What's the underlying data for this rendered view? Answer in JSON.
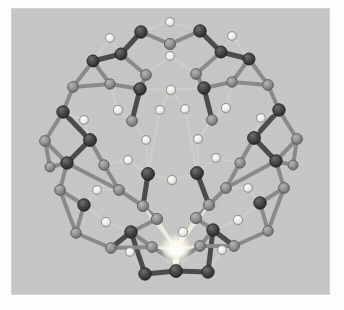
{
  "figure": {
    "kind": "molecular-structure-render",
    "background_color": "#c7c7c7",
    "page_color": "#fdfdfd",
    "panel": {
      "x": 11,
      "y": 8,
      "width": 319,
      "height": 287
    }
  },
  "palette": {
    "background": "#c7c7c7",
    "atom_dark": "#3b3b3b",
    "atom_dark_edge": "#202020",
    "atom_mid": "#8e8e8e",
    "atom_mid_edge": "#5e5e5e",
    "atom_light": "#e9e9e4",
    "atom_light_edge": "#9a9a95",
    "bond_dark": "#4a4a4a",
    "bond_mid": "#8a8a8a",
    "bond_light": "#cfcfca",
    "highlight": "#ffffff",
    "highlight_glow": "#fffdf2"
  },
  "legend": {
    "atom_types": [
      {
        "name": "dark-vertex-atom",
        "color": "#3b3b3b",
        "radius": 6.4,
        "role": "framework tetrahedral site"
      },
      {
        "name": "mid-vertex-atom",
        "color": "#8e8e8e",
        "radius": 5.6,
        "role": "framework tetrahedral site (back face)"
      },
      {
        "name": "light-bridge-atom",
        "color": "#e9e9e4",
        "radius": 4.6,
        "role": "bridging atom"
      },
      {
        "name": "highlight-atom",
        "color": "#ffffff",
        "radius": 5.0,
        "role": "selected / emitting atom"
      }
    ]
  },
  "structure": {
    "highlight_atom": {
      "id": "H0",
      "x": 176,
      "y": 249,
      "r": 5.2,
      "type": "highlight"
    },
    "atoms": [
      {
        "id": "a0",
        "x": 170,
        "y": 22,
        "r": 4.4,
        "type": "light"
      },
      {
        "id": "a1",
        "x": 141,
        "y": 32,
        "r": 6.2,
        "type": "dark"
      },
      {
        "id": "a2",
        "x": 200,
        "y": 31,
        "r": 6.2,
        "type": "dark"
      },
      {
        "id": "a3",
        "x": 170,
        "y": 44,
        "r": 5.6,
        "type": "mid"
      },
      {
        "id": "a4",
        "x": 170,
        "y": 56,
        "r": 4.4,
        "type": "light"
      },
      {
        "id": "a5",
        "x": 121,
        "y": 54,
        "r": 6.0,
        "type": "dark"
      },
      {
        "id": "a6",
        "x": 221,
        "y": 52,
        "r": 6.0,
        "type": "dark"
      },
      {
        "id": "a7",
        "x": 146,
        "y": 75,
        "r": 5.4,
        "type": "mid"
      },
      {
        "id": "a8",
        "x": 196,
        "y": 74,
        "r": 5.4,
        "type": "mid"
      },
      {
        "id": "a9",
        "x": 171,
        "y": 90,
        "r": 4.6,
        "type": "light"
      },
      {
        "id": "a10",
        "x": 140,
        "y": 89,
        "r": 6.2,
        "type": "dark"
      },
      {
        "id": "a11",
        "x": 204,
        "y": 88,
        "r": 6.2,
        "type": "dark"
      },
      {
        "id": "a12",
        "x": 93,
        "y": 61,
        "r": 6.0,
        "type": "dark"
      },
      {
        "id": "a13",
        "x": 249,
        "y": 59,
        "r": 6.0,
        "type": "dark"
      },
      {
        "id": "a14",
        "x": 73,
        "y": 87,
        "r": 5.4,
        "type": "mid"
      },
      {
        "id": "a15",
        "x": 268,
        "y": 85,
        "r": 5.4,
        "type": "mid"
      },
      {
        "id": "a16",
        "x": 110,
        "y": 84,
        "r": 5.2,
        "type": "mid"
      },
      {
        "id": "a17",
        "x": 232,
        "y": 82,
        "r": 5.2,
        "type": "mid"
      },
      {
        "id": "a18",
        "x": 63,
        "y": 112,
        "r": 6.2,
        "type": "dark"
      },
      {
        "id": "a19",
        "x": 279,
        "y": 110,
        "r": 6.2,
        "type": "dark"
      },
      {
        "id": "a20",
        "x": 118,
        "y": 110,
        "r": 4.6,
        "type": "light"
      },
      {
        "id": "a21",
        "x": 226,
        "y": 108,
        "r": 4.6,
        "type": "light"
      },
      {
        "id": "a22",
        "x": 132,
        "y": 121,
        "r": 5.4,
        "type": "mid"
      },
      {
        "id": "a23",
        "x": 212,
        "y": 120,
        "r": 5.4,
        "type": "mid"
      },
      {
        "id": "a24",
        "x": 146,
        "y": 140,
        "r": 4.4,
        "type": "light"
      },
      {
        "id": "a25",
        "x": 198,
        "y": 139,
        "r": 4.4,
        "type": "light"
      },
      {
        "id": "a26",
        "x": 90,
        "y": 140,
        "r": 6.4,
        "type": "dark"
      },
      {
        "id": "a27",
        "x": 254,
        "y": 138,
        "r": 6.4,
        "type": "dark"
      },
      {
        "id": "a28",
        "x": 45,
        "y": 141,
        "r": 5.4,
        "type": "mid"
      },
      {
        "id": "a29",
        "x": 297,
        "y": 139,
        "r": 5.4,
        "type": "mid"
      },
      {
        "id": "a30",
        "x": 67,
        "y": 163,
        "r": 6.2,
        "type": "dark"
      },
      {
        "id": "a31",
        "x": 276,
        "y": 161,
        "r": 6.2,
        "type": "dark"
      },
      {
        "id": "a32",
        "x": 104,
        "y": 165,
        "r": 5.2,
        "type": "mid"
      },
      {
        "id": "a33",
        "x": 240,
        "y": 163,
        "r": 5.2,
        "type": "mid"
      },
      {
        "id": "a34",
        "x": 148,
        "y": 174,
        "r": 6.4,
        "type": "dark"
      },
      {
        "id": "a35",
        "x": 197,
        "y": 173,
        "r": 6.4,
        "type": "dark"
      },
      {
        "id": "a36",
        "x": 172,
        "y": 180,
        "r": 4.6,
        "type": "light"
      },
      {
        "id": "a37",
        "x": 119,
        "y": 190,
        "r": 5.4,
        "type": "mid"
      },
      {
        "id": "a38",
        "x": 226,
        "y": 188,
        "r": 5.4,
        "type": "mid"
      },
      {
        "id": "a39",
        "x": 60,
        "y": 190,
        "r": 5.4,
        "type": "mid"
      },
      {
        "id": "a40",
        "x": 284,
        "y": 188,
        "r": 5.4,
        "type": "mid"
      },
      {
        "id": "a41",
        "x": 84,
        "y": 205,
        "r": 6.2,
        "type": "dark"
      },
      {
        "id": "a42",
        "x": 260,
        "y": 203,
        "r": 6.2,
        "type": "dark"
      },
      {
        "id": "a43",
        "x": 106,
        "y": 222,
        "r": 4.6,
        "type": "light"
      },
      {
        "id": "a44",
        "x": 238,
        "y": 220,
        "r": 4.6,
        "type": "light"
      },
      {
        "id": "a45",
        "x": 131,
        "y": 232,
        "r": 6.2,
        "type": "dark"
      },
      {
        "id": "a46",
        "x": 213,
        "y": 230,
        "r": 6.2,
        "type": "dark"
      },
      {
        "id": "a47",
        "x": 152,
        "y": 247,
        "r": 5.4,
        "type": "mid"
      },
      {
        "id": "a48",
        "x": 200,
        "y": 246,
        "r": 5.4,
        "type": "mid"
      },
      {
        "id": "a49",
        "x": 176,
        "y": 271,
        "r": 6.4,
        "type": "dark"
      },
      {
        "id": "a50",
        "x": 145,
        "y": 274,
        "r": 6.2,
        "type": "dark"
      },
      {
        "id": "a51",
        "x": 208,
        "y": 272,
        "r": 6.2,
        "type": "dark"
      },
      {
        "id": "a52",
        "x": 176,
        "y": 262,
        "r": 4.4,
        "type": "light"
      },
      {
        "id": "a53",
        "x": 157,
        "y": 219,
        "r": 5.6,
        "type": "mid"
      },
      {
        "id": "a54",
        "x": 196,
        "y": 218,
        "r": 5.6,
        "type": "mid"
      },
      {
        "id": "a55",
        "x": 143,
        "y": 206,
        "r": 5.6,
        "type": "mid"
      },
      {
        "id": "a56",
        "x": 209,
        "y": 205,
        "r": 5.6,
        "type": "mid"
      },
      {
        "id": "a57",
        "x": 183,
        "y": 232,
        "r": 4.6,
        "type": "light"
      },
      {
        "id": "a58",
        "x": 111,
        "y": 248,
        "r": 5.4,
        "type": "mid"
      },
      {
        "id": "a59",
        "x": 234,
        "y": 246,
        "r": 5.4,
        "type": "mid"
      },
      {
        "id": "a60",
        "x": 76,
        "y": 233,
        "r": 5.2,
        "type": "mid"
      },
      {
        "id": "a61",
        "x": 268,
        "y": 231,
        "r": 5.2,
        "type": "mid"
      },
      {
        "id": "a62",
        "x": 50,
        "y": 167,
        "r": 5.0,
        "type": "mid"
      },
      {
        "id": "a63",
        "x": 293,
        "y": 165,
        "r": 5.0,
        "type": "mid"
      },
      {
        "id": "a64",
        "x": 160,
        "y": 110,
        "r": 4.4,
        "type": "light"
      },
      {
        "id": "a65",
        "x": 185,
        "y": 109,
        "r": 4.4,
        "type": "light"
      },
      {
        "id": "a66",
        "x": 128,
        "y": 160,
        "r": 4.4,
        "type": "light"
      },
      {
        "id": "a67",
        "x": 216,
        "y": 158,
        "r": 4.4,
        "type": "light"
      },
      {
        "id": "a68",
        "x": 97,
        "y": 190,
        "r": 4.4,
        "type": "light"
      },
      {
        "id": "a69",
        "x": 248,
        "y": 188,
        "r": 4.4,
        "type": "light"
      },
      {
        "id": "a70",
        "x": 84,
        "y": 120,
        "r": 4.4,
        "type": "light"
      },
      {
        "id": "a71",
        "x": 261,
        "y": 118,
        "r": 4.4,
        "type": "light"
      },
      {
        "id": "a72",
        "x": 130,
        "y": 252,
        "r": 4.4,
        "type": "light"
      },
      {
        "id": "a73",
        "x": 222,
        "y": 250,
        "r": 4.4,
        "type": "light"
      },
      {
        "id": "a74",
        "x": 110,
        "y": 38,
        "r": 4.4,
        "type": "light"
      },
      {
        "id": "a75",
        "x": 232,
        "y": 36,
        "r": 4.4,
        "type": "light"
      }
    ],
    "bonds": [
      [
        "a0",
        "a1",
        "light"
      ],
      [
        "a0",
        "a2",
        "light"
      ],
      [
        "a1",
        "a3",
        "mid"
      ],
      [
        "a2",
        "a3",
        "mid"
      ],
      [
        "a3",
        "a4",
        "light"
      ],
      [
        "a1",
        "a5",
        "dark"
      ],
      [
        "a2",
        "a6",
        "dark"
      ],
      [
        "a5",
        "a7",
        "mid"
      ],
      [
        "a6",
        "a8",
        "mid"
      ],
      [
        "a4",
        "a7",
        "light"
      ],
      [
        "a4",
        "a8",
        "light"
      ],
      [
        "a7",
        "a10",
        "mid"
      ],
      [
        "a8",
        "a11",
        "mid"
      ],
      [
        "a10",
        "a9",
        "light"
      ],
      [
        "a11",
        "a9",
        "light"
      ],
      [
        "a5",
        "a12",
        "dark"
      ],
      [
        "a6",
        "a13",
        "dark"
      ],
      [
        "a12",
        "a14",
        "mid"
      ],
      [
        "a13",
        "a15",
        "mid"
      ],
      [
        "a12",
        "a16",
        "mid"
      ],
      [
        "a13",
        "a17",
        "mid"
      ],
      [
        "a16",
        "a10",
        "mid"
      ],
      [
        "a17",
        "a11",
        "mid"
      ],
      [
        "a14",
        "a18",
        "mid"
      ],
      [
        "a15",
        "a19",
        "mid"
      ],
      [
        "a16",
        "a20",
        "light"
      ],
      [
        "a17",
        "a21",
        "light"
      ],
      [
        "a20",
        "a22",
        "light"
      ],
      [
        "a21",
        "a23",
        "light"
      ],
      [
        "a10",
        "a22",
        "dark"
      ],
      [
        "a11",
        "a23",
        "dark"
      ],
      [
        "a22",
        "a24",
        "light"
      ],
      [
        "a23",
        "a25",
        "light"
      ],
      [
        "a24",
        "a34",
        "light"
      ],
      [
        "a25",
        "a35",
        "light"
      ],
      [
        "a18",
        "a26",
        "dark"
      ],
      [
        "a19",
        "a27",
        "dark"
      ],
      [
        "a18",
        "a28",
        "mid"
      ],
      [
        "a19",
        "a29",
        "mid"
      ],
      [
        "a26",
        "a70",
        "light"
      ],
      [
        "a27",
        "a71",
        "light"
      ],
      [
        "a70",
        "a18",
        "light"
      ],
      [
        "a71",
        "a19",
        "light"
      ],
      [
        "a26",
        "a30",
        "dark"
      ],
      [
        "a27",
        "a31",
        "dark"
      ],
      [
        "a28",
        "a30",
        "mid"
      ],
      [
        "a29",
        "a31",
        "mid"
      ],
      [
        "a26",
        "a32",
        "mid"
      ],
      [
        "a27",
        "a33",
        "mid"
      ],
      [
        "a32",
        "a66",
        "light"
      ],
      [
        "a33",
        "a67",
        "light"
      ],
      [
        "a66",
        "a34",
        "light"
      ],
      [
        "a67",
        "a35",
        "light"
      ],
      [
        "a30",
        "a62",
        "mid"
      ],
      [
        "a31",
        "a63",
        "mid"
      ],
      [
        "a30",
        "a37",
        "mid"
      ],
      [
        "a31",
        "a38",
        "mid"
      ],
      [
        "a32",
        "a37",
        "mid"
      ],
      [
        "a33",
        "a38",
        "mid"
      ],
      [
        "a34",
        "a36",
        "light"
      ],
      [
        "a35",
        "a36",
        "light"
      ],
      [
        "a34",
        "a55",
        "dark"
      ],
      [
        "a35",
        "a56",
        "dark"
      ],
      [
        "a37",
        "a68",
        "light"
      ],
      [
        "a38",
        "a69",
        "light"
      ],
      [
        "a68",
        "a41",
        "light"
      ],
      [
        "a69",
        "a42",
        "light"
      ],
      [
        "a30",
        "a39",
        "mid"
      ],
      [
        "a31",
        "a40",
        "mid"
      ],
      [
        "a39",
        "a41",
        "mid"
      ],
      [
        "a40",
        "a42",
        "mid"
      ],
      [
        "a41",
        "a43",
        "light"
      ],
      [
        "a42",
        "a44",
        "light"
      ],
      [
        "a43",
        "a45",
        "light"
      ],
      [
        "a44",
        "a46",
        "light"
      ],
      [
        "a41",
        "a60",
        "mid"
      ],
      [
        "a42",
        "a61",
        "mid"
      ],
      [
        "a60",
        "a58",
        "mid"
      ],
      [
        "a61",
        "a59",
        "mid"
      ],
      [
        "a45",
        "a47",
        "mid"
      ],
      [
        "a46",
        "a48",
        "mid"
      ],
      [
        "a45",
        "a58",
        "dark"
      ],
      [
        "a46",
        "a59",
        "dark"
      ],
      [
        "a58",
        "a72",
        "light"
      ],
      [
        "a59",
        "a73",
        "light"
      ],
      [
        "a72",
        "a50",
        "light"
      ],
      [
        "a73",
        "a51",
        "light"
      ],
      [
        "a47",
        "a52",
        "mid"
      ],
      [
        "a48",
        "a52",
        "mid"
      ],
      [
        "a49",
        "a52",
        "dark"
      ],
      [
        "a49",
        "a50",
        "dark"
      ],
      [
        "a49",
        "a51",
        "dark"
      ],
      [
        "a50",
        "a45",
        "dark"
      ],
      [
        "a51",
        "a46",
        "dark"
      ],
      [
        "a45",
        "a53",
        "mid"
      ],
      [
        "a46",
        "a54",
        "mid"
      ],
      [
        "a53",
        "a55",
        "mid"
      ],
      [
        "a54",
        "a56",
        "mid"
      ],
      [
        "a55",
        "a37",
        "mid"
      ],
      [
        "a56",
        "a38",
        "mid"
      ],
      [
        "a57",
        "a49",
        "light"
      ],
      [
        "a64",
        "a34",
        "light"
      ],
      [
        "a65",
        "a35",
        "light"
      ],
      [
        "a9",
        "a64",
        "light"
      ],
      [
        "a9",
        "a65",
        "light"
      ],
      [
        "a74",
        "a5",
        "light"
      ],
      [
        "a75",
        "a6",
        "light"
      ],
      [
        "a74",
        "a12",
        "light"
      ],
      [
        "a75",
        "a13",
        "light"
      ],
      [
        "a14",
        "a16",
        "mid"
      ],
      [
        "a15",
        "a17",
        "mid"
      ],
      [
        "a28",
        "a62",
        "mid"
      ],
      [
        "a29",
        "a63",
        "mid"
      ],
      [
        "a39",
        "a60",
        "mid"
      ],
      [
        "a40",
        "a61",
        "mid"
      ],
      [
        "a47",
        "a58",
        "mid"
      ],
      [
        "a48",
        "a59",
        "mid"
      ]
    ],
    "highlight_bonds": [
      [
        "H0",
        "a53"
      ],
      [
        "H0",
        "a54"
      ],
      [
        "H0",
        "a55"
      ],
      [
        "H0",
        "a56"
      ],
      [
        "H0",
        "a47"
      ],
      [
        "H0",
        "a48"
      ],
      [
        "H0",
        "a52"
      ],
      [
        "H0",
        "a57"
      ],
      [
        "H0",
        "a49"
      ]
    ]
  }
}
